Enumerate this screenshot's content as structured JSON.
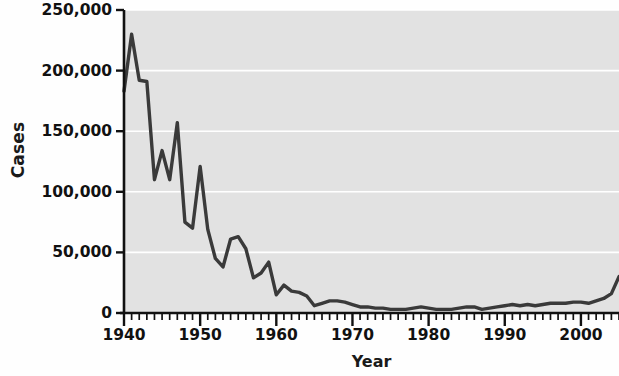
{
  "chart_data": {
    "type": "line",
    "title": "",
    "xlabel": "Year",
    "ylabel": "Cases",
    "xlim": [
      1940,
      2005
    ],
    "ylim": [
      0,
      250000
    ],
    "grid": true,
    "grid_color": "#ffffff",
    "legend": null,
    "line_color": "#3a3a3a",
    "plot_background": "#e2e2e2",
    "figure_background": "#fefefe",
    "y_ticks": [
      0,
      50000,
      100000,
      150000,
      200000,
      250000
    ],
    "y_tick_labels": [
      "0",
      "50,000",
      "100,000",
      "150,000",
      "200,000",
      "250,000"
    ],
    "x_ticks": [
      1940,
      1950,
      1960,
      1970,
      1980,
      1990,
      2000
    ],
    "x_tick_labels": [
      "1940",
      "1950",
      "1960",
      "1970",
      "1980",
      "1990",
      "2000"
    ],
    "x_minor_tick_interval": 1,
    "x": [
      1940,
      1941,
      1942,
      1943,
      1944,
      1945,
      1946,
      1947,
      1948,
      1949,
      1950,
      1951,
      1952,
      1953,
      1954,
      1955,
      1956,
      1957,
      1958,
      1959,
      1960,
      1961,
      1962,
      1963,
      1964,
      1965,
      1966,
      1967,
      1968,
      1969,
      1970,
      1971,
      1972,
      1973,
      1974,
      1975,
      1976,
      1977,
      1978,
      1979,
      1980,
      1981,
      1982,
      1983,
      1984,
      1985,
      1986,
      1987,
      1988,
      1989,
      1990,
      1991,
      1992,
      1993,
      1994,
      1995,
      1996,
      1997,
      1998,
      1999,
      2000,
      2001,
      2002,
      2003,
      2004,
      2005
    ],
    "values": [
      183000,
      230000,
      192000,
      191000,
      110000,
      134000,
      110000,
      157000,
      75000,
      70000,
      121000,
      69000,
      45000,
      38000,
      61000,
      63000,
      53000,
      29000,
      33000,
      42000,
      15000,
      23000,
      18000,
      17000,
      14000,
      6000,
      8000,
      10000,
      10000,
      9000,
      7000,
      5000,
      5000,
      4000,
      4000,
      3000,
      3000,
      3000,
      4000,
      5000,
      4000,
      3000,
      3000,
      3000,
      4000,
      5000,
      5000,
      3000,
      4000,
      5000,
      6000,
      7000,
      6000,
      7000,
      6000,
      7000,
      8000,
      8000,
      8000,
      9000,
      9000,
      8000,
      10000,
      12000,
      16000,
      30000
    ],
    "series_name": "Cases"
  },
  "axes": {
    "y_title": "Cases",
    "x_title": "Year"
  }
}
